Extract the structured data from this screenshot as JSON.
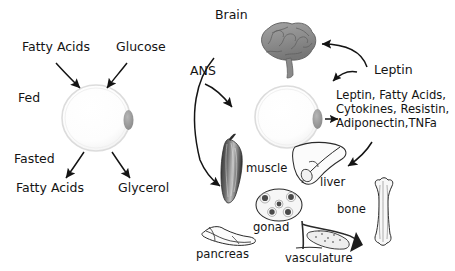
{
  "diagram": {
    "left_panel": {
      "state_fed": "Fed",
      "state_fasted": "Fasted",
      "inputs": [
        "Fatty Acids",
        "Glucose"
      ],
      "outputs": [
        "Fatty Acids",
        "Glycerol"
      ],
      "cell_name": "adipocyte"
    },
    "right_panel": {
      "brain_label": "Brain",
      "ans_label": "ANS",
      "leptin_label": "Leptin",
      "secreted_factors": "Leptin, Fatty Acids,\nCytokines, Resistin,\nAdiponectin,TNFa",
      "secreted_factors_lines": [
        "Leptin, Fatty Acids,",
        "Cytokines, Resistin,",
        "Adiponectin,TNFa"
      ],
      "cell_name": "adipocyte",
      "organs": [
        {
          "label": "muscle"
        },
        {
          "label": "liver"
        },
        {
          "label": "gonad"
        },
        {
          "label": "bone"
        },
        {
          "label": "pancreas"
        },
        {
          "label": "vasculature"
        }
      ]
    },
    "colors": {
      "background": "#ffffff",
      "ink": "#141414",
      "stroke": "#1a1a1a",
      "cell_outline": "#dcdcdc",
      "cell_fill": "#fdfdfd",
      "nucleus": "#9a9a9a",
      "brain_fill": "#8e8e8e",
      "brain_shade": "#6f6f6f",
      "organ_fill": "#f3f3f3",
      "organ_dark": "#3a3a3a"
    }
  }
}
